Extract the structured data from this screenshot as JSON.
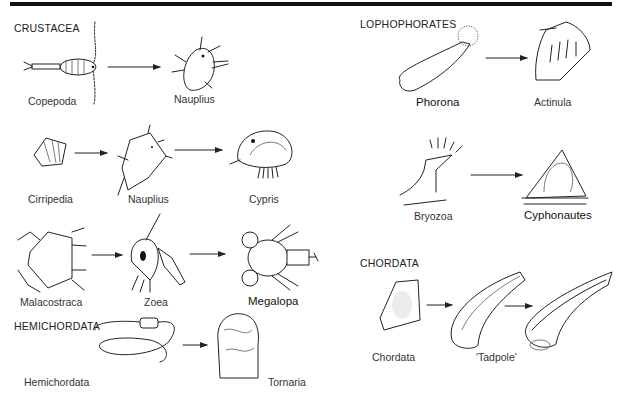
{
  "figure": {
    "groups": [
      {
        "heading": "CRUSTACEA",
        "rows": [
          {
            "stages": [
              "Copepoda",
              "Nauplius"
            ]
          },
          {
            "stages": [
              "Cirripedia",
              "Nauplius",
              "Cypris"
            ]
          },
          {
            "stages": [
              "Malacostraca",
              "Zoea",
              "Megalopa"
            ]
          }
        ]
      },
      {
        "heading": "HEMICHORDATA",
        "rows": [
          {
            "stages": [
              "Hemichordata",
              "Tornaria"
            ]
          }
        ]
      },
      {
        "heading": "LOPHOPHORATES",
        "rows": [
          {
            "stages": [
              "Phorona",
              "Actinula"
            ]
          },
          {
            "stages": [
              "Bryozoa",
              "Cyphonautes"
            ]
          }
        ]
      },
      {
        "heading": "CHORDATA",
        "rows": [
          {
            "stages": [
              "Chordata",
              "'Tadpole'"
            ]
          }
        ]
      }
    ]
  }
}
